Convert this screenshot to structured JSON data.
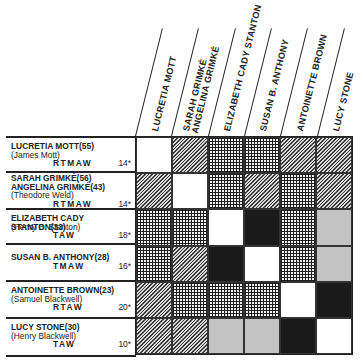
{
  "diagram": {
    "type": "relationship-matrix",
    "columns": [
      {
        "label": "LUCRETIA MOTT",
        "lines": [
          "LUCRETIA MOTT"
        ]
      },
      {
        "label": "SARAH GRIMKÉ / ANGELINA GRIMKÉ",
        "lines": [
          "SARAH GRIMKÉ",
          "ANGELINA GRIMKÉ"
        ]
      },
      {
        "label": "ELIZABETH CADY STANTON",
        "lines": [
          "ELIZABETH CADY STANTON"
        ]
      },
      {
        "label": "SUSAN B. ANTHONY",
        "lines": [
          "SUSAN B. ANTHONY"
        ]
      },
      {
        "label": "ANTOINETTE BROWN",
        "lines": [
          "ANTOINETTE BROWN"
        ]
      },
      {
        "label": "LUCY STONE",
        "lines": [
          "LUCY STONE"
        ]
      }
    ],
    "rows": [
      {
        "name_lines": [
          "LUCRETIA MOTT(55)"
        ],
        "spouse": "(James Mott)",
        "initials": "R T M A W",
        "number": "14*"
      },
      {
        "name_lines": [
          "SARAH GRIMKÉ(56)",
          "ANGELINA GRIMKÉ(43)"
        ],
        "spouse": "(Theodore Weld)",
        "initials": "R T M A W",
        "number": "14*"
      },
      {
        "name_lines": [
          "ELIZABETH CADY STANTON(33)"
        ],
        "spouse": "(Henry B. Stanton)",
        "initials": "T A W",
        "number": "18*"
      },
      {
        "name_lines": [
          "SUSAN B. ANTHONY(28)"
        ],
        "spouse": "",
        "initials": "T M A W",
        "number": "16*"
      },
      {
        "name_lines": [
          "ANTOINETTE BROWN(23)"
        ],
        "spouse": "(Samuel Blackwell)",
        "initials": "R T A W",
        "number": "20*"
      },
      {
        "name_lines": [
          "LUCY STONE(30)"
        ],
        "spouse": "(Henry Blackwell)",
        "initials": "T A W",
        "number": "10*"
      }
    ],
    "matrix": [
      [
        "white",
        "hatch",
        "grid",
        "grid",
        "hatch",
        "hatch"
      ],
      [
        "hatch",
        "white",
        "grid",
        "hatch",
        "grid",
        "hatch"
      ],
      [
        "grid",
        "grid",
        "white",
        "black",
        "grid",
        "dots"
      ],
      [
        "grid",
        "hatch",
        "black",
        "white",
        "grid",
        "dots"
      ],
      [
        "hatch",
        "grid",
        "grid",
        "grid",
        "white",
        "black"
      ],
      [
        "hatch",
        "hatch",
        "dots",
        "dots",
        "black",
        "white"
      ]
    ],
    "pattern_colors": {
      "white": "#ffffff",
      "black": "#1a1a1a",
      "hatch": "#8a8a8a",
      "grid": "#5a5a5a",
      "dots": "#d8d8d8"
    }
  }
}
